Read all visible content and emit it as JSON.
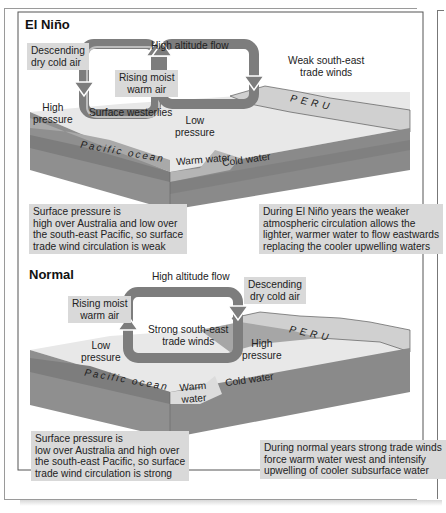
{
  "el_nino": {
    "title": "El Niño",
    "labels": {
      "descending_line1": "Descending",
      "descending_line2": "dry cold air",
      "high_altitude_flow": "High altitude flow",
      "rising_line1": "Rising moist",
      "rising_line2": "warm air",
      "weak_trade_line1": "Weak south-east",
      "weak_trade_line2": "trade winds",
      "high_pressure_line1": "High",
      "high_pressure_line2": "pressure",
      "surface_westerlies": "Surface westerlies",
      "low_pressure_line1": "Low",
      "low_pressure_line2": "pressure",
      "peru": "PERU",
      "pacific_ocean": "Pacific ocean",
      "warm_water": "Warm water",
      "cold_water": "Cold water"
    },
    "caption_left": [
      "Surface pressure is",
      "high over Australia and low over",
      "the south-east Pacific, so surface",
      "trade wind circulation is weak"
    ],
    "caption_right": [
      "During El Niño years the weaker",
      "atmospheric circulation allows the",
      "lighter, warmer water to flow eastwards",
      "replacing the cooler upwelling waters"
    ]
  },
  "normal": {
    "title": "Normal",
    "labels": {
      "high_altitude_flow": "High altitude flow",
      "descending_line1": "Descending",
      "descending_line2": "dry cold air",
      "rising_line1": "Rising moist",
      "rising_line2": "warm air",
      "strong_trade_line1": "Strong south-east",
      "strong_trade_line2": "trade winds",
      "low_pressure_line1": "Low",
      "low_pressure_line2": "pressure",
      "high_pressure_line1": "High",
      "high_pressure_line2": "pressure",
      "peru": "PERU",
      "pacific_ocean": "Pacific ocean",
      "warm_water_line1": "Warm",
      "warm_water_line2": "water",
      "cold_water": "Cold water"
    },
    "caption_left": [
      "Surface pressure is",
      "low over Australia and high over",
      "the south-east Pacific, so surface",
      "trade wind circulation is strong"
    ],
    "caption_right": [
      "During normal years strong trade winds",
      "force warm water west and intensify",
      "upwelling of cooler subsurface water"
    ]
  },
  "colors": {
    "sea_surface": "#e6e6e6",
    "block_side_dark": "#8c8c8c",
    "block_side_mid": "#9e9e9e",
    "warm_layer": "#b3b3b3",
    "land": "#cfcfcf",
    "arrow": "#7d7d7d",
    "caption_bg": "#d9d9d9"
  }
}
